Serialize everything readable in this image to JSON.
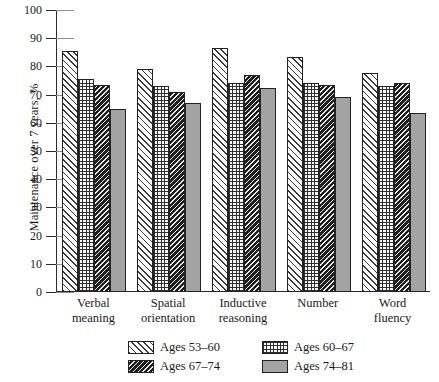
{
  "chart_data": {
    "type": "bar",
    "title": "",
    "xlabel": "",
    "ylabel": "Maintenance over 7 years, %",
    "ylim": [
      0,
      100
    ],
    "ytick_labels": [
      "0",
      "10",
      "20",
      "30",
      "40",
      "50",
      "60",
      "70",
      "80",
      "90",
      "100"
    ],
    "ytick_values": [
      0,
      10,
      20,
      30,
      40,
      50,
      60,
      70,
      80,
      90,
      100
    ],
    "grid": false,
    "legend_position": "bottom",
    "categories": [
      "Verbal meaning",
      "Spatial orientation",
      "Inductive reasoning",
      "Number",
      "Word fluency"
    ],
    "category_lines": [
      [
        "Verbal",
        "meaning"
      ],
      [
        "Spatial",
        "orientation"
      ],
      [
        "Inductive",
        "reasoning"
      ],
      [
        "Number",
        ""
      ],
      [
        "Word",
        "fluency"
      ]
    ],
    "series": [
      {
        "name": "Ages 53–60",
        "pattern": "diagonal-hatch",
        "values": [
          85.5,
          79.0,
          86.5,
          83.5,
          77.5
        ]
      },
      {
        "name": "Ages 60–67",
        "pattern": "grid-crosshatch",
        "values": [
          75.5,
          73.0,
          74.0,
          74.0,
          73.0
        ]
      },
      {
        "name": "Ages 67–74",
        "pattern": "dense-dark-diagonal",
        "values": [
          73.5,
          71.0,
          77.0,
          73.5,
          74.0
        ]
      },
      {
        "name": "Ages 74–81",
        "pattern": "solid-gray",
        "values": [
          65.0,
          67.0,
          72.5,
          69.0,
          63.5
        ]
      }
    ]
  },
  "legend": {
    "items": [
      {
        "label": "Ages 53–60"
      },
      {
        "label": "Ages 60–67"
      },
      {
        "label": "Ages 67–74"
      },
      {
        "label": "Ages 74–81"
      }
    ]
  }
}
